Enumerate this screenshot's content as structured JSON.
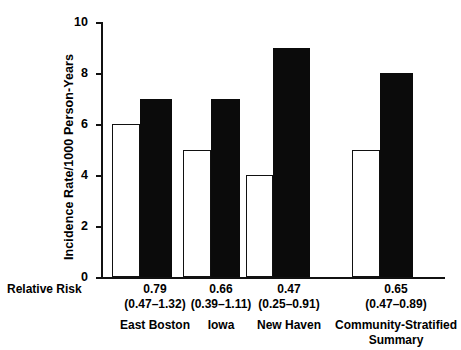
{
  "chart_data": {
    "type": "bar",
    "title": "",
    "xlabel": "",
    "ylabel": "Incidence Rate/1000 Person-Years",
    "ylim": [
      0,
      10
    ],
    "yticks": [
      0,
      2,
      4,
      6,
      8,
      10
    ],
    "grid": false,
    "legend": "none",
    "categories": [
      "East Boston",
      "Iowa",
      "New Haven",
      "Community-Stratified\nSummary"
    ],
    "series": [
      {
        "name": "open-bar",
        "values": [
          6,
          5,
          4,
          5
        ]
      },
      {
        "name": "filled-bar",
        "values": [
          7,
          7,
          9,
          8
        ]
      }
    ],
    "annotations": {
      "row_label": "Relative Risk",
      "relative_risk": [
        "0.79",
        "0.66",
        "0.47",
        "0.65"
      ],
      "confidence_intervals": [
        "(0.47–1.32)",
        "(0.39–1.11)",
        "(0.25–0.91)",
        "(0.47–0.89)"
      ]
    },
    "colors": {
      "open_bar_fill": "#ffffff",
      "open_bar_stroke": "#111111",
      "filled_bar_fill": "#0b0b0b",
      "axis": "#111111",
      "text": "#000000",
      "background": "#ffffff"
    }
  },
  "caption": ""
}
